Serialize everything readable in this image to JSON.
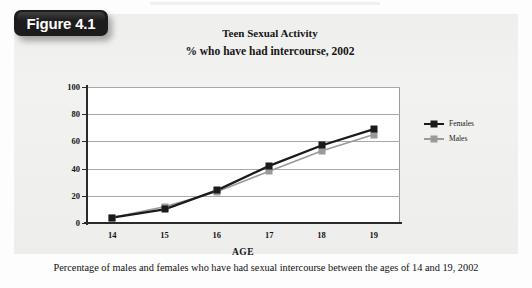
{
  "figure": {
    "badge_label": "Figure 4.1",
    "caption": "Percentage of males and females who have had sexual intercourse between the ages of 14 and 19, 2002"
  },
  "colors": {
    "females_series": "#1a1a1a",
    "males_series": "#9a9a9a",
    "gridline": "#a9a9a9",
    "axis": "#2a2a2a",
    "plot_background": "#ffffff",
    "page_background": "#f2f2f1",
    "badge_background": "#1c1c1c",
    "badge_text": "#ffffff"
  },
  "chart_data": {
    "type": "line",
    "title": "Teen Sexual Activity",
    "subtitle": "% who have had intercourse, 2002",
    "xlabel": "AGE",
    "ylabel": "",
    "categories": [
      "14",
      "15",
      "16",
      "17",
      "18",
      "19"
    ],
    "x": [
      14,
      15,
      16,
      17,
      18,
      19
    ],
    "series": [
      {
        "name": "Females",
        "values": [
          4,
          10,
          24,
          42,
          57,
          69
        ],
        "color": "#1a1a1a",
        "marker": "square"
      },
      {
        "name": "Males",
        "values": [
          4,
          12,
          23,
          38,
          53,
          65
        ],
        "color": "#9a9a9a",
        "marker": "square"
      }
    ],
    "ylim": [
      0,
      100
    ],
    "yticks": [
      0,
      20,
      40,
      60,
      80,
      100
    ],
    "ytick_labels": [
      "0",
      "20",
      "40",
      "60",
      "80",
      "100"
    ],
    "xtick_labels": [
      "14",
      "15",
      "16",
      "17",
      "18",
      "19"
    ],
    "grid": true,
    "grid_axis": "y",
    "legend": [
      "Females",
      "Males"
    ],
    "legend_position": "right"
  }
}
